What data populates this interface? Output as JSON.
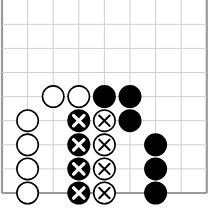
{
  "board": {
    "type": "go-diagram",
    "edges": [
      "left",
      "right",
      "bottom"
    ],
    "columns": 9,
    "rows": 9,
    "origin_x": 2,
    "origin_y": 0.2,
    "spacing_x": 25.6,
    "spacing_y": 24.1,
    "stone_radius": 11.5,
    "colors": {
      "grid_line": "#cfcfcf",
      "edge_line": "#9a9a9a",
      "black_stone": "#000000",
      "white_stone": "#ffffff",
      "stone_outline": "#000000"
    },
    "stones": [
      {
        "col": 2,
        "row": 4,
        "color": "white",
        "mark": ""
      },
      {
        "col": 3,
        "row": 4,
        "color": "white",
        "mark": ""
      },
      {
        "col": 4,
        "row": 4,
        "color": "black",
        "mark": ""
      },
      {
        "col": 5,
        "row": 4,
        "color": "black",
        "mark": ""
      },
      {
        "col": 1,
        "row": 5,
        "color": "white",
        "mark": ""
      },
      {
        "col": 3,
        "row": 5,
        "color": "black",
        "mark": "X"
      },
      {
        "col": 4,
        "row": 5,
        "color": "white",
        "mark": "X"
      },
      {
        "col": 5,
        "row": 5,
        "color": "black",
        "mark": ""
      },
      {
        "col": 1,
        "row": 6,
        "color": "white",
        "mark": ""
      },
      {
        "col": 3,
        "row": 6,
        "color": "black",
        "mark": "X"
      },
      {
        "col": 4,
        "row": 6,
        "color": "white",
        "mark": "X"
      },
      {
        "col": 6,
        "row": 6,
        "color": "black",
        "mark": ""
      },
      {
        "col": 1,
        "row": 7,
        "color": "white",
        "mark": ""
      },
      {
        "col": 3,
        "row": 7,
        "color": "black",
        "mark": "X"
      },
      {
        "col": 4,
        "row": 7,
        "color": "white",
        "mark": "X"
      },
      {
        "col": 6,
        "row": 7,
        "color": "black",
        "mark": ""
      },
      {
        "col": 1,
        "row": 8,
        "color": "white",
        "mark": ""
      },
      {
        "col": 3,
        "row": 8,
        "color": "black",
        "mark": "X"
      },
      {
        "col": 4,
        "row": 8,
        "color": "white",
        "mark": "X"
      },
      {
        "col": 6,
        "row": 8,
        "color": "black",
        "mark": ""
      }
    ]
  }
}
